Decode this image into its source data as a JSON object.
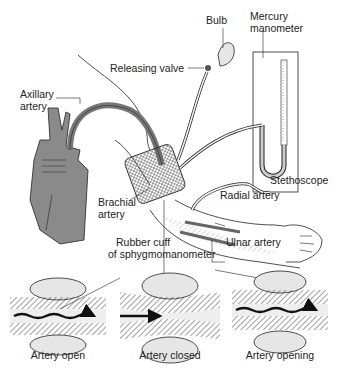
{
  "labels": {
    "bulb": "Bulb",
    "mercury_manometer_line1": "Mercury",
    "mercury_manometer_line2": "manometer",
    "releasing_valve": "Releasing valve",
    "axillary_artery_line1": "Axillary",
    "axillary_artery_line2": "artery",
    "stethoscope": "Stethoscope",
    "brachial_artery_line1": "Brachial",
    "brachial_artery_line2": "artery",
    "radial_artery": "Radial artery",
    "rubber_cuff_line1": "Rubber cuff",
    "rubber_cuff_line2": "of sphygmomanometer",
    "ulnar_artery": "Ulnar artery"
  },
  "panels": [
    {
      "caption": "Artery open"
    },
    {
      "caption": "Artery closed"
    },
    {
      "caption": "Artery opening"
    }
  ],
  "colors": {
    "line": "#222222",
    "artery_fill": "#999999",
    "cuff_fill": "#e6e6e6",
    "heart_fill": "#8a8a8a",
    "background": "#ffffff"
  }
}
